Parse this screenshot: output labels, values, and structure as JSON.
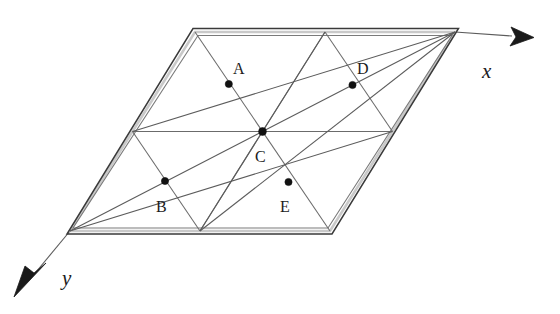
{
  "figure": {
    "background_color": "#ffffff",
    "ink_color": "#1c1c1c",
    "axes": {
      "x": {
        "label": "x",
        "label_pos": {
          "x": 482,
          "y": 78
        },
        "start": {
          "x": 455,
          "y": 32
        },
        "end": {
          "x": 512,
          "y": 36
        },
        "arrow_tip": {
          "x": 534,
          "y": 37
        },
        "arrow_name": "x-axis-arrow"
      },
      "y": {
        "label": "y",
        "label_pos": {
          "x": 62,
          "y": 285
        },
        "start": {
          "x": 70,
          "y": 231
        },
        "end": {
          "x": 36,
          "y": 272
        },
        "arrow_tip": {
          "x": 14,
          "y": 297
        },
        "arrow_name": "y-axis-arrow"
      }
    },
    "cell": {
      "corners": {
        "top_left": {
          "x": 195,
          "y": 32
        },
        "top_right": {
          "x": 455,
          "y": 32
        },
        "bottom_right": {
          "x": 330,
          "y": 231
        },
        "bottom_left": {
          "x": 70,
          "y": 231
        }
      },
      "edge_midpoints": {
        "top": {
          "x": 325,
          "y": 32
        },
        "bottom": {
          "x": 200,
          "y": 231
        },
        "left": {
          "x": 132.5,
          "y": 131.5
        },
        "right": {
          "x": 392.5,
          "y": 131.5
        }
      },
      "center": {
        "x": 262.5,
        "y": 131.5
      }
    },
    "points": [
      {
        "id": "A",
        "label": "A",
        "dot": {
          "x": 228.8,
          "y": 84
        },
        "label_pos": {
          "x": 233,
          "y": 74
        }
      },
      {
        "id": "D",
        "label": "D",
        "dot": {
          "x": 352.5,
          "y": 85
        },
        "label_pos": {
          "x": 357,
          "y": 74
        }
      },
      {
        "id": "C",
        "label": "C",
        "dot": {
          "x": 262.5,
          "y": 131.5
        },
        "label_pos": {
          "x": 255,
          "y": 162
        }
      },
      {
        "id": "B",
        "label": "B",
        "dot": {
          "x": 165,
          "y": 181
        },
        "label_pos": {
          "x": 156,
          "y": 212
        }
      },
      {
        "id": "E",
        "label": "E",
        "dot": {
          "x": 288.5,
          "y": 182
        },
        "label_pos": {
          "x": 280,
          "y": 212
        }
      }
    ],
    "grid_lines": [
      {
        "name": "horizontal-median",
        "from": {
          "x": 132.5,
          "y": 131.5
        },
        "to": {
          "x": 392.5,
          "y": 131.5
        }
      },
      {
        "name": "vertical-median",
        "from": {
          "x": 325,
          "y": 32
        },
        "to": {
          "x": 200,
          "y": 231
        }
      },
      {
        "name": "cell-diagonal-tl-br",
        "from": {
          "x": 195,
          "y": 32
        },
        "to": {
          "x": 330,
          "y": 231
        }
      },
      {
        "name": "quad-diagonal-upper-left",
        "from": {
          "x": 195,
          "y": 32
        },
        "to": {
          "x": 262.5,
          "y": 131.5
        }
      },
      {
        "name": "quad-diagonal-upper-right",
        "from": {
          "x": 325,
          "y": 32
        },
        "to": {
          "x": 392.5,
          "y": 131.5
        }
      },
      {
        "name": "quad-diagonal-lower-left",
        "from": {
          "x": 132.5,
          "y": 131.5
        },
        "to": {
          "x": 200,
          "y": 231
        }
      },
      {
        "name": "quad-diagonal-lower-right",
        "from": {
          "x": 262.5,
          "y": 131.5
        },
        "to": {
          "x": 330,
          "y": 231
        }
      },
      {
        "name": "sub-diagonal-top-mid-center",
        "from": {
          "x": 325,
          "y": 32
        },
        "to": {
          "x": 262.5,
          "y": 131.5
        }
      },
      {
        "name": "sub-diagonal-center-bottom-mid",
        "from": {
          "x": 262.5,
          "y": 131.5
        },
        "to": {
          "x": 200,
          "y": 231
        }
      }
    ],
    "long_diagonals": [
      {
        "name": "diagonal-bl-tr",
        "from": {
          "x": 70,
          "y": 231
        },
        "to": {
          "x": 455,
          "y": 32
        }
      },
      {
        "name": "diagonal-left-mid-to-top-right",
        "from": {
          "x": 132.5,
          "y": 131.5
        },
        "to": {
          "x": 455,
          "y": 32
        }
      },
      {
        "name": "diagonal-bottom-left-to-right-mid",
        "from": {
          "x": 70,
          "y": 231
        },
        "to": {
          "x": 392.5,
          "y": 131.5
        }
      },
      {
        "name": "diagonal-bottom-mid-to-top-right",
        "from": {
          "x": 200,
          "y": 231
        },
        "to": {
          "x": 455,
          "y": 32
        }
      }
    ]
  }
}
